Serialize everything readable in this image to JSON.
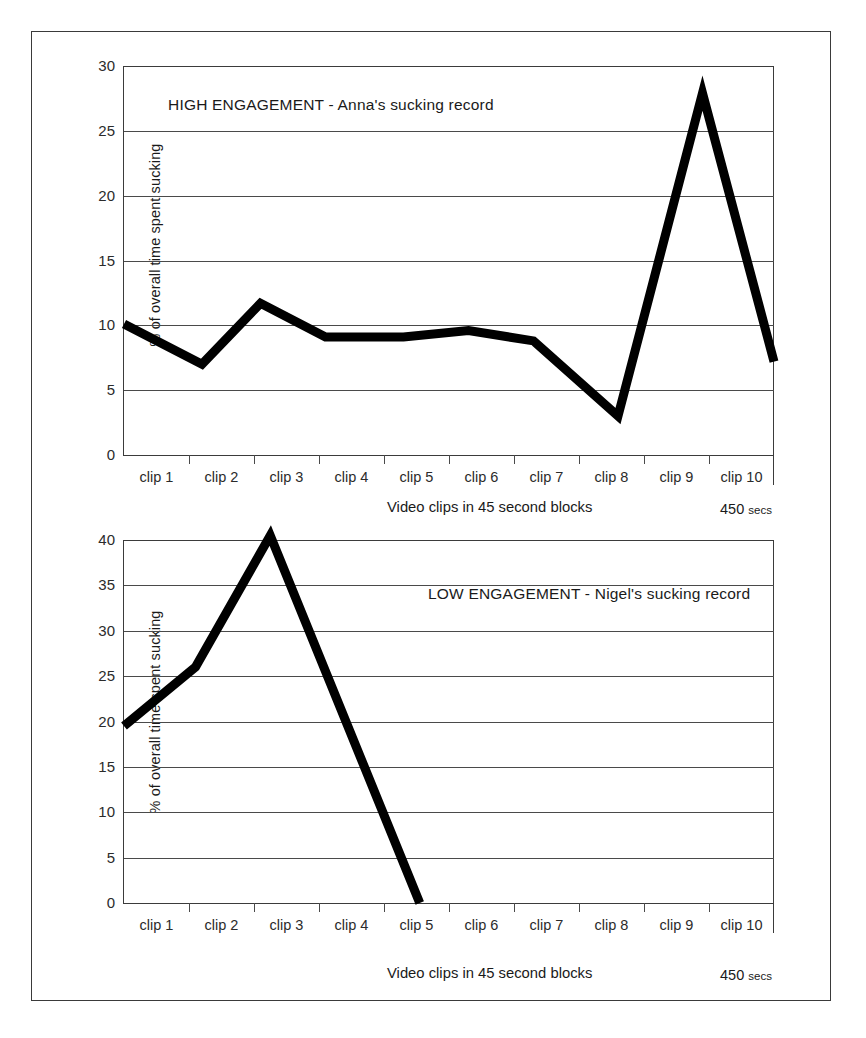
{
  "figure": {
    "clipped_header_text": "",
    "shared": {
      "ylabel": "% of overall time spent sucking",
      "xlabel": "Video clips in 45 second blocks",
      "x_end_note_value": "450",
      "x_end_note_unit": "secs",
      "xtick_labels": [
        "clip 1",
        "clip 2",
        "clip 3",
        "clip 4",
        "clip 5",
        "clip 6",
        "clip 7",
        "clip 8",
        "clip 9",
        "clip 10"
      ]
    }
  },
  "chart_data": [
    {
      "type": "line",
      "id": "high-engagement",
      "title": "HIGH ENGAGEMENT - Anna's sucking record",
      "xlabel": "Video clips in 45 second blocks",
      "ylabel": "% of overall time spent sucking",
      "categories": [
        "clip 1",
        "clip 2",
        "clip 3",
        "clip 4",
        "clip 5",
        "clip 6",
        "clip 7",
        "clip 8",
        "clip 9",
        "clip 10"
      ],
      "x": [
        0,
        1,
        2,
        3,
        4,
        5,
        6,
        7,
        8,
        9,
        10
      ],
      "values": [
        10.1,
        7.0,
        11.7,
        9.1,
        9.1,
        9.6,
        8.8,
        3.0,
        27.9,
        7.2
      ],
      "points": [
        {
          "x": 0,
          "y": 10.1
        },
        {
          "x": 1.2,
          "y": 7.0
        },
        {
          "x": 2.1,
          "y": 11.7
        },
        {
          "x": 3.1,
          "y": 9.1
        },
        {
          "x": 4.3,
          "y": 9.1
        },
        {
          "x": 5.3,
          "y": 9.6
        },
        {
          "x": 6.3,
          "y": 8.8
        },
        {
          "x": 7.6,
          "y": 3.0
        },
        {
          "x": 8.9,
          "y": 27.9
        },
        {
          "x": 10,
          "y": 7.2
        }
      ],
      "ylim": [
        0,
        30
      ],
      "yticks": [
        0,
        5,
        10,
        15,
        20,
        25,
        30
      ],
      "ytick_labels": [
        "0",
        "5",
        "10",
        "15",
        "20",
        "25",
        "30"
      ],
      "xlim": [
        0,
        10
      ],
      "grid": true,
      "legend": "none",
      "line_color": "#000000",
      "end_note": "450 secs"
    },
    {
      "type": "line",
      "id": "low-engagement",
      "title": "LOW ENGAGEMENT - Nigel's sucking record",
      "xlabel": "Video clips in 45 second blocks",
      "ylabel": "% of overall time spent sucking",
      "categories": [
        "clip 1",
        "clip 2",
        "clip 3",
        "clip 4",
        "clip 5",
        "clip 6",
        "clip 7",
        "clip 8",
        "clip 9",
        "clip 10"
      ],
      "x": [
        0,
        1,
        2,
        3,
        4
      ],
      "values": [
        19.5,
        26.0,
        40.5,
        0.0
      ],
      "points": [
        {
          "x": 0,
          "y": 19.5
        },
        {
          "x": 1.1,
          "y": 26.0
        },
        {
          "x": 2.25,
          "y": 40.5
        },
        {
          "x": 4.55,
          "y": 0.0
        }
      ],
      "ylim": [
        0,
        40
      ],
      "yticks": [
        0,
        5,
        10,
        15,
        20,
        25,
        30,
        35,
        40
      ],
      "ytick_labels": [
        "0",
        "5",
        "10",
        "15",
        "20",
        "25",
        "30",
        "35",
        "40"
      ],
      "xlim": [
        0,
        10
      ],
      "grid": true,
      "legend": "none",
      "line_color": "#000000",
      "end_note": "450 secs"
    }
  ]
}
